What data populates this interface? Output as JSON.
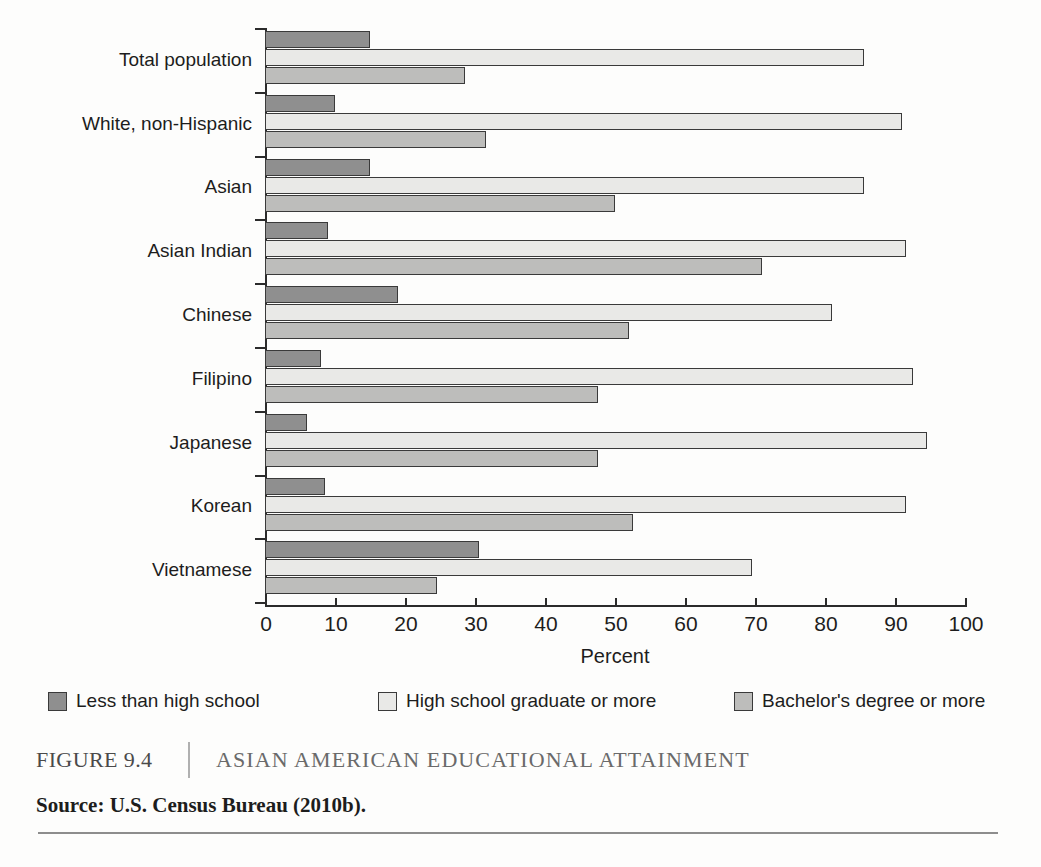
{
  "figure": {
    "number_label": "FIGURE 9.4",
    "title": "ASIAN AMERICAN EDUCATIONAL ATTAINMENT",
    "source": "Source: U.S. Census Bureau (2010b)."
  },
  "legend": {
    "position": "below-axis",
    "items": [
      {
        "label": "Less than high school",
        "color": "#8f8f8f"
      },
      {
        "label": "High school graduate or more",
        "color": "#e9e9e7"
      },
      {
        "label": "Bachelor's degree or more",
        "color": "#bdbdbb"
      }
    ]
  },
  "chart_data": {
    "type": "bar",
    "orientation": "horizontal",
    "title": "Asian American Educational Attainment",
    "subtitle": "",
    "xlabel": "Percent",
    "ylabel": "",
    "xlim": [
      0,
      100
    ],
    "xticks": [
      0,
      10,
      20,
      30,
      40,
      50,
      60,
      70,
      80,
      90,
      100
    ],
    "xticklabels": [
      "0",
      "10",
      "20",
      "30",
      "40",
      "50",
      "60",
      "70",
      "80",
      "90",
      "100"
    ],
    "grid": false,
    "legend_position": "bottom",
    "categories": [
      "Total population",
      "White, non-Hispanic",
      "Asian",
      "Asian Indian",
      "Chinese",
      "Filipino",
      "Japanese",
      "Korean",
      "Vietnamese"
    ],
    "series": [
      {
        "name": "Less than high school",
        "color": "#8f8f8f",
        "values": [
          15,
          10,
          15,
          9,
          19,
          8,
          6,
          8.5,
          30.5
        ]
      },
      {
        "name": "High school graduate or more",
        "color": "#e9e9e7",
        "values": [
          85.5,
          91,
          85.5,
          91.5,
          81,
          92.5,
          94.5,
          91.5,
          69.5
        ]
      },
      {
        "name": "Bachelor's degree or more",
        "color": "#bdbdbb",
        "values": [
          28.5,
          31.5,
          50,
          71,
          52,
          47.5,
          47.5,
          52.5,
          24.5
        ]
      }
    ]
  }
}
